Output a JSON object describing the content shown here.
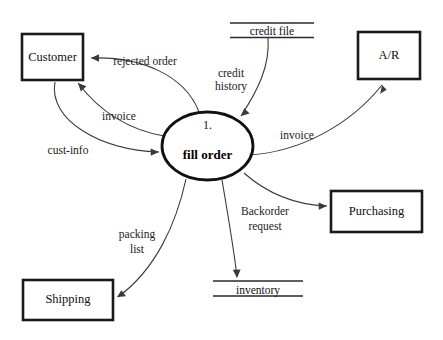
{
  "diagram": {
    "type": "data-flow-diagram",
    "background_color": "#ffffff",
    "line_color": "#3a3a3a",
    "text_color": "#101010",
    "process": {
      "number": "1.",
      "name": "fill order"
    },
    "external_entities": [
      {
        "id": "customer",
        "label": "Customer"
      },
      {
        "id": "ar",
        "label": "A/R"
      },
      {
        "id": "purchasing",
        "label": "Purchasing"
      },
      {
        "id": "shipping",
        "label": "Shipping"
      }
    ],
    "data_stores": [
      {
        "id": "credit-file",
        "label": "credit file"
      },
      {
        "id": "inventory",
        "label": "inventory"
      }
    ],
    "data_flows": [
      {
        "id": "rejected-order",
        "label": "rejected order",
        "from": "fill order",
        "to": "Customer"
      },
      {
        "id": "invoice-customer",
        "label": "invoice",
        "from": "fill order",
        "to": "Customer"
      },
      {
        "id": "cust-info",
        "label": "cust-info",
        "from": "Customer",
        "to": "fill order"
      },
      {
        "id": "credit-history",
        "label_line1": "credit",
        "label_line2": "history",
        "label": "credit history",
        "from": "credit file",
        "to": "fill order"
      },
      {
        "id": "invoice-ar",
        "label": "invoice",
        "from": "fill order",
        "to": "A/R"
      },
      {
        "id": "backorder-request",
        "label_line1": "Backorder",
        "label_line2": "request",
        "label": "Backorder request",
        "from": "fill order",
        "to": "Purchasing"
      },
      {
        "id": "packing-list",
        "label_line1": "packing",
        "label_line2": "list",
        "label": "packing list",
        "from": "fill order",
        "to": "Shipping"
      },
      {
        "id": "inventory-flow",
        "label": "",
        "from": "fill order",
        "to": "inventory"
      }
    ]
  }
}
